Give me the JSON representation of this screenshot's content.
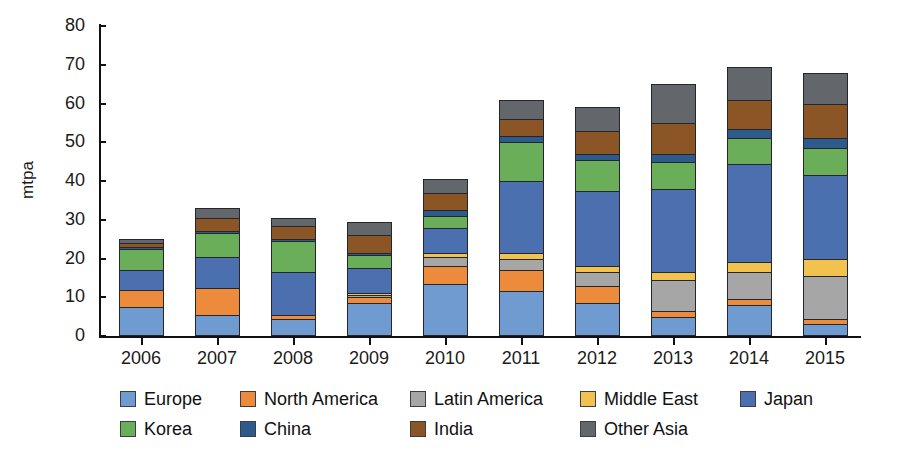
{
  "chart_data": {
    "type": "bar",
    "stacked": true,
    "title": "",
    "subtitle": "",
    "xlabel": "",
    "ylabel": "mtpa",
    "ylim": [
      0,
      80
    ],
    "yticks": [
      0,
      10,
      20,
      30,
      40,
      50,
      60,
      70,
      80
    ],
    "grid": false,
    "legend_position": "bottom",
    "categories": [
      "2006",
      "2007",
      "2008",
      "2009",
      "2010",
      "2011",
      "2012",
      "2013",
      "2014",
      "2015"
    ],
    "series": [
      {
        "name": "Europe",
        "color": "#6F9BD1",
        "values": [
          7.5,
          5.5,
          4.5,
          8.5,
          13.5,
          11.5,
          8.5,
          5.0,
          8.0,
          3.0
        ]
      },
      {
        "name": "North America",
        "color": "#ED8B3C",
        "values": [
          4.5,
          7.0,
          1.0,
          1.5,
          4.5,
          5.5,
          4.5,
          1.5,
          1.5,
          1.5
        ]
      },
      {
        "name": "Latin America",
        "color": "#A6A6A6",
        "values": [
          0.0,
          0.0,
          0.0,
          0.5,
          2.5,
          3.0,
          3.5,
          8.0,
          7.0,
          11.0
        ]
      },
      {
        "name": "Middle East",
        "color": "#F2C24E",
        "values": [
          0.0,
          0.0,
          0.0,
          0.5,
          1.0,
          1.5,
          1.5,
          2.0,
          2.5,
          4.5
        ]
      },
      {
        "name": "Japan",
        "color": "#4C6FAF",
        "values": [
          5.0,
          8.0,
          11.0,
          6.5,
          6.5,
          18.5,
          19.5,
          21.5,
          25.5,
          21.5
        ]
      },
      {
        "name": "Korea",
        "color": "#6BAE5A",
        "values": [
          5.5,
          6.0,
          8.0,
          3.5,
          3.0,
          10.0,
          8.0,
          7.0,
          6.5,
          7.0
        ]
      },
      {
        "name": "China",
        "color": "#2E5A8C",
        "values": [
          0.5,
          0.5,
          0.5,
          0.5,
          1.5,
          1.5,
          1.5,
          2.0,
          2.5,
          2.5
        ]
      },
      {
        "name": "India",
        "color": "#8C5526",
        "values": [
          1.0,
          3.5,
          3.5,
          4.5,
          4.5,
          4.5,
          6.0,
          8.0,
          7.5,
          9.0
        ]
      },
      {
        "name": "Other Asia",
        "color": "#63666A",
        "values": [
          1.0,
          2.5,
          2.0,
          3.5,
          3.5,
          5.0,
          6.0,
          10.0,
          8.5,
          8.0
        ]
      }
    ],
    "totals": [
      25.0,
      33.0,
      30.5,
      29.5,
      40.5,
      61.0,
      59.0,
      65.0,
      69.5,
      68.0
    ]
  },
  "legend": {
    "row_0": [
      "Europe",
      "North America",
      "Latin America",
      "Middle East",
      "Japan"
    ],
    "row_1": [
      "Korea",
      "China",
      "India",
      "Other Asia"
    ]
  }
}
